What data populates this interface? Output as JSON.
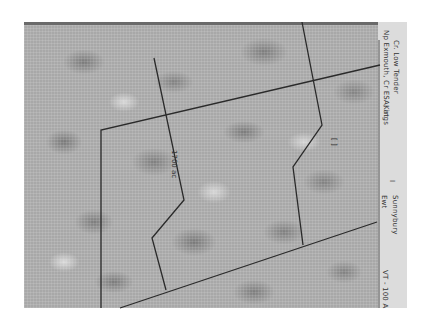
{
  "map": {
    "type": "scanned plat / survey map",
    "background": "mottled gray halftone",
    "line_color": "#2a2a2a",
    "parcel_labels": [
      "1700 ac",
      "[ ]"
    ],
    "panel": {
      "line1": "Kings",
      "line2": "Np Exmouth, Cr ESA, at",
      "line3": "Cr. Low Tender",
      "line4": "I",
      "line5": "Sunnybury",
      "line6": "Ewt",
      "line7": "VT - 100 A"
    }
  }
}
